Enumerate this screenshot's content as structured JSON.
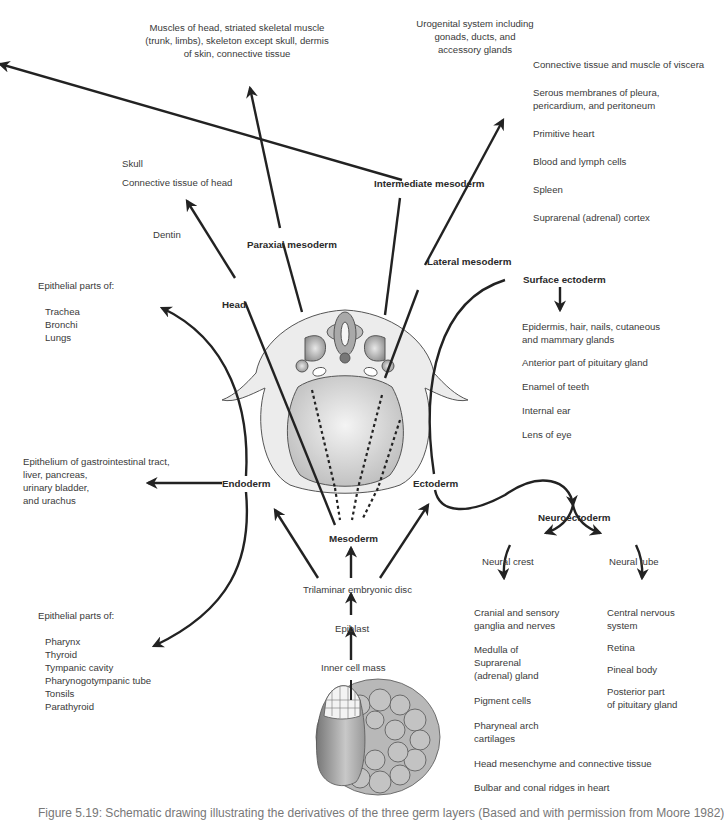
{
  "nodes": {
    "paraxial_mesoderm": "Paraxial mesoderm",
    "intermediate_mesoderm": "Intermediate mesoderm",
    "lateral_mesoderm": "Lateral mesoderm",
    "head": "Head",
    "surface_ectoderm": "Surface ectoderm",
    "endoderm": "Endoderm",
    "ectoderm": "Ectoderm",
    "mesoderm": "Mesoderm",
    "neuroectoderm": "Neuroectoderm",
    "neural_crest": "Neural crest",
    "neural_tube": "Neural tube",
    "trilaminar_disc": "Trilaminar embryonic disc",
    "epiblast": "Epiblast",
    "inner_cell_mass": "Inner cell mass"
  },
  "paraxial_derivatives": {
    "line1": "Muscles of head, striated skeletal muscle",
    "line2": "(trunk, limbs), skeleton except skull, dermis",
    "line3": "of skin, connective tissue"
  },
  "intermediate_derivatives": {
    "line1": "Urogenital system including",
    "line2": "gonads, ducts, and",
    "line3": "accessory glands"
  },
  "lateral_derivatives": [
    "Connective tissue and muscle of viscera",
    "Serous membranes of pleura,",
    "pericardium, and peritoneum",
    "Primitive heart",
    "Blood and lymph cells",
    "Spleen",
    "Suprarenal (adrenal) cortex"
  ],
  "head_derivatives": [
    "Skull",
    "Connective tissue of head",
    "Dentin"
  ],
  "endoderm_upper": {
    "heading": "Epithelial parts of:",
    "items": [
      "Trachea",
      "Bronchi",
      "Lungs"
    ]
  },
  "endoderm_middle": [
    "Epithelium of gastrointestinal tract,",
    "liver, pancreas,",
    "urinary bladder,",
    "and urachus"
  ],
  "endoderm_lower": {
    "heading": "Epithelial parts of:",
    "items": [
      "Pharynx",
      "Thyroid",
      "Tympanic cavity",
      "Pharynogotympanic tube",
      "Tonsils",
      "Parathyroid"
    ]
  },
  "surface_ectoderm_derivatives": [
    "Epidermis, hair, nails, cutaneous",
    "and mammary glands",
    "Anterior part of pituitary gland",
    "Enamel of teeth",
    "Internal ear",
    "Lens of eye"
  ],
  "neural_crest_derivatives": [
    "Cranial and sensory",
    "ganglia and nerves",
    "Medulla of",
    "Suprarenal",
    "(adrenal) gland",
    "Pigment cells",
    "Pharyneal arch",
    "cartilages",
    "Head mesenchyme and connective tissue",
    "Bulbar and conal ridges in heart"
  ],
  "neural_tube_derivatives": [
    "Central nervous",
    "system",
    "Retina",
    "Pineal body",
    "Posterior part",
    "of pituitary gland"
  ],
  "caption": "Figure 5.19: Schematic drawing illustrating the derivatives of the three germ layers (Based and with permission from Moore 1982)",
  "colors": {
    "line": "#222222",
    "embryo_fill": "#d9d9d9",
    "embryo_dark": "#9a9a9a"
  }
}
